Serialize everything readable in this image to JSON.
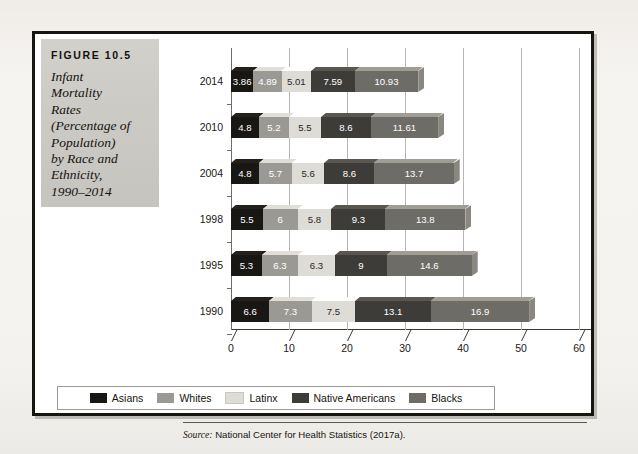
{
  "figure": {
    "number_label": "FIGURE 10.5",
    "title_lines": [
      "Infant",
      "Mortality",
      "Rates",
      "(Percentage of",
      "Population)",
      "by Race and",
      "Ethnicity,",
      "1990–2014"
    ],
    "source_prefix": "Source:",
    "source_text": "National Center for Health Statistics (2017a)."
  },
  "chart_data": {
    "type": "bar",
    "orientation": "horizontal",
    "stacked": true,
    "xlabel": "",
    "ylabel": "",
    "categories": [
      "2014",
      "2010",
      "2004",
      "1998",
      "1995",
      "1990"
    ],
    "xlim": [
      0,
      60
    ],
    "xticks": [
      0,
      10,
      20,
      30,
      40,
      50,
      60
    ],
    "xtick_labels": [
      "0",
      "10",
      "20",
      "30",
      "40",
      "50",
      "60"
    ],
    "grid": true,
    "legend_position": "bottom",
    "series": [
      {
        "name": "Asians",
        "color": "#191714",
        "values": [
          3.86,
          4.8,
          4.8,
          5.5,
          5.3,
          6.6
        ],
        "labels": [
          "3.86",
          "4.8",
          "4.8",
          "5.5",
          "5.3",
          "6.6"
        ]
      },
      {
        "name": "Whites",
        "color": "#9b9994",
        "values": [
          4.89,
          5.2,
          5.7,
          6,
          6.3,
          7.3
        ],
        "labels": [
          "4.89",
          "5.2",
          "5.7",
          "6",
          "6.3",
          "7.3"
        ]
      },
      {
        "name": "Latinx",
        "color": "#dedcd7",
        "values": [
          5.01,
          5.5,
          5.6,
          5.8,
          6.3,
          7.5
        ],
        "labels": [
          "5.01",
          "5.5",
          "5.6",
          "5.8",
          "6.3",
          "7.5"
        ]
      },
      {
        "name": "Native Americans",
        "color": "#3e3c38",
        "values": [
          7.59,
          8.6,
          8.6,
          9.3,
          9,
          13.1
        ],
        "labels": [
          "7.59",
          "8.6",
          "8.6",
          "9.3",
          "9",
          "13.1"
        ]
      },
      {
        "name": "Blacks",
        "color": "#6e6c67",
        "values": [
          10.93,
          11.61,
          13.7,
          13.8,
          14.6,
          16.9
        ],
        "labels": [
          "10.93",
          "11.61",
          "13.7",
          "13.8",
          "14.6",
          "16.9"
        ]
      }
    ],
    "row_totals": [
      32.28,
      35.71,
      38.4,
      40.4,
      41.5,
      51.4
    ]
  }
}
